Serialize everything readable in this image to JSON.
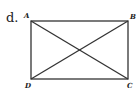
{
  "item_label": "d.",
  "vertices": {
    "A": {
      "label": "A",
      "x": 31,
      "y": 21
    },
    "B": {
      "label": "B",
      "x": 128,
      "y": 21
    },
    "C": {
      "label": "C",
      "x": 128,
      "y": 79
    },
    "D": {
      "label": "D",
      "x": 31,
      "y": 79
    }
  },
  "shape": "rectangle",
  "segments": [
    "AB",
    "BC",
    "CD",
    "DA",
    "AC",
    "BD"
  ],
  "stroke_color": "#333333"
}
